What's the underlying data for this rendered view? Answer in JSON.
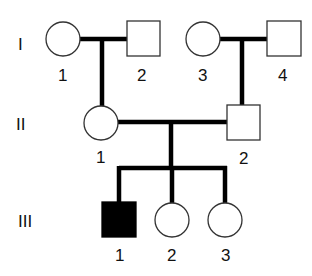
{
  "pedigree": {
    "generations": [
      {
        "label": "I",
        "members": [
          {
            "id": "I-1",
            "number": "1",
            "sex": "female",
            "affected": false
          },
          {
            "id": "I-2",
            "number": "2",
            "sex": "male",
            "affected": false
          },
          {
            "id": "I-3",
            "number": "3",
            "sex": "female",
            "affected": false
          },
          {
            "id": "I-4",
            "number": "4",
            "sex": "male",
            "affected": false
          }
        ]
      },
      {
        "label": "II",
        "members": [
          {
            "id": "II-1",
            "number": "1",
            "sex": "female",
            "affected": false
          },
          {
            "id": "II-2",
            "number": "2",
            "sex": "male",
            "affected": false
          }
        ]
      },
      {
        "label": "III",
        "members": [
          {
            "id": "III-1",
            "number": "1",
            "sex": "male",
            "affected": true
          },
          {
            "id": "III-2",
            "number": "2",
            "sex": "female",
            "affected": false
          },
          {
            "id": "III-3",
            "number": "3",
            "sex": "female",
            "affected": false
          }
        ]
      }
    ],
    "matings": [
      {
        "partners": [
          "I-1",
          "I-2"
        ],
        "children": [
          "II-1"
        ]
      },
      {
        "partners": [
          "I-3",
          "I-4"
        ],
        "children": [
          "II-2"
        ]
      },
      {
        "partners": [
          "II-1",
          "II-2"
        ],
        "children": [
          "III-1",
          "III-2",
          "III-3"
        ]
      }
    ]
  }
}
